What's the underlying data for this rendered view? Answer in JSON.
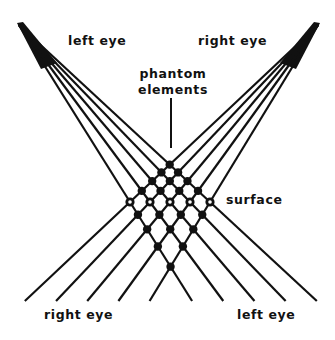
{
  "labels": {
    "top_left": "left eye",
    "top_right": "right eye",
    "phantom_line1": "phantom",
    "phantom_line2": "elements",
    "surface": "surface",
    "bottom_left": "right eye",
    "bottom_right": "left eye"
  },
  "colors": {
    "ink": "#111111",
    "background": "#ffffff"
  },
  "geometry": {
    "left_apex": [
      19,
      25
    ],
    "right_apex": [
      318,
      25
    ],
    "surface_y": 202,
    "surface_x": [
      130,
      150,
      170,
      190,
      210
    ],
    "bottom_y": 301,
    "phantom_pointer": [
      171,
      98,
      171,
      148
    ]
  }
}
